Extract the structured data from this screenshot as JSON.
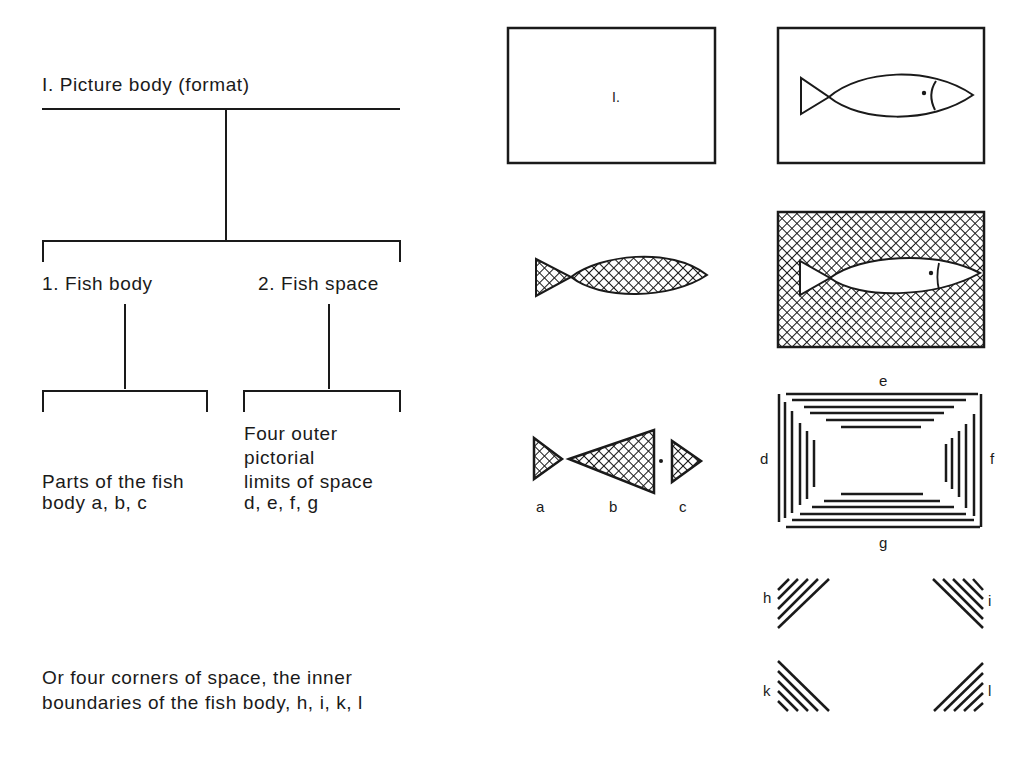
{
  "tree": {
    "root": "I. Picture body (format)",
    "branch1": "1. Fish body",
    "branch2": "2. Fish space",
    "leaf1_line1": "Parts of the fish",
    "leaf1_line2": "body a, b, c",
    "leaf2_line1": "Four outer",
    "leaf2_line2": "pictorial",
    "leaf2_line3": "limits of space",
    "leaf2_line4": "d, e, f, g",
    "footer_line1": "Or four corners of space, the inner",
    "footer_line2": "boundaries of the fish body, h, i, k, l"
  },
  "figures": {
    "format_box_label": "I.",
    "parts_labels": [
      "a",
      "b",
      "c"
    ],
    "limit_labels": {
      "top": "e",
      "left": "d",
      "right": "f",
      "bottom": "g"
    },
    "corner_labels": {
      "top_left": "h",
      "top_right": "i",
      "bottom_left": "k",
      "bottom_right": "l"
    }
  },
  "colors": {
    "ink": "#1a1a1a",
    "paper": "#ffffff"
  }
}
